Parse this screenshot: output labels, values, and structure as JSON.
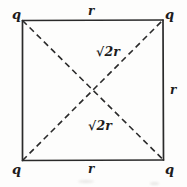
{
  "figure": {
    "shape": "square",
    "stroke_color": "#2a2a2a",
    "background_color": "#fdfdfc",
    "square": {
      "left": 22,
      "top": 20,
      "right": 163,
      "bottom": 160
    },
    "corners": [
      {
        "id": "top-left",
        "label": "q"
      },
      {
        "id": "top-right",
        "label": "q"
      },
      {
        "id": "bottom-left",
        "label": "q"
      },
      {
        "id": "bottom-right",
        "label": "q"
      }
    ],
    "sides": [
      {
        "id": "top",
        "label": "r"
      },
      {
        "id": "bottom",
        "label": "r"
      },
      {
        "id": "right",
        "label": "r"
      }
    ],
    "diagonals": [
      {
        "id": "upper",
        "from": "bottom-left",
        "to": "top-right",
        "style": "dashed",
        "radical": "√",
        "radicand": "2",
        "variable": "r"
      },
      {
        "id": "lower",
        "from": "top-left",
        "to": "bottom-right",
        "style": "dashed",
        "radical": "√",
        "radicand": "2",
        "variable": "r"
      }
    ],
    "intersection": {
      "x": 93,
      "y": 90
    }
  }
}
